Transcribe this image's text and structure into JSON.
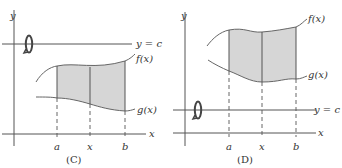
{
  "panels": [
    {
      "id": "C",
      "caption": "(C)",
      "labels": {
        "y_axis": "y",
        "x_axis": "x",
        "line": "y = c",
        "upper_curve": "f(x)",
        "lower_curve": "g(x)",
        "a": "a",
        "x": "x",
        "b": "b"
      },
      "axis_of_rotation": "above region"
    },
    {
      "id": "D",
      "caption": "(D)",
      "labels": {
        "y_axis": "y",
        "x_axis": "x",
        "line": "y = c",
        "upper_curve": "f(x)",
        "lower_curve": "g(x)",
        "a": "a",
        "x": "x",
        "b": "b"
      },
      "axis_of_rotation": "below region"
    }
  ],
  "colors": {
    "region_fill": "#d6d6d6",
    "line": "#555555",
    "text": "#333333"
  }
}
